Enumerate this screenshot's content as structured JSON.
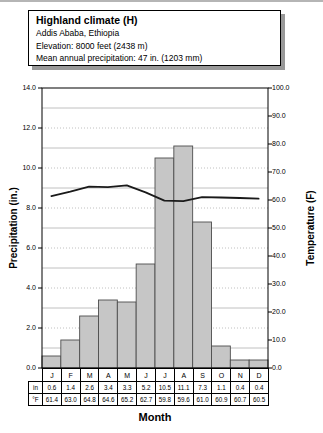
{
  "header": {
    "title": "Highland climate (H)",
    "city": "Addis Ababa, Ethiopia",
    "elevation": "Elevation: 8000 feet (2438 m)",
    "precipitation": "Mean annual precipitation: 47 in. (1203 mm)"
  },
  "chart_data": {
    "type": "bar",
    "categories": [
      "J",
      "F",
      "M",
      "A",
      "M",
      "J",
      "J",
      "A",
      "S",
      "O",
      "N",
      "D"
    ],
    "series": [
      {
        "name": "Precipitation",
        "type": "bar",
        "axis": "left",
        "values": [
          0.6,
          1.4,
          2.6,
          3.4,
          3.3,
          5.2,
          10.5,
          11.1,
          7.3,
          1.1,
          0.4,
          0.4
        ]
      },
      {
        "name": "Temperature",
        "type": "line",
        "axis": "right",
        "values": [
          61.4,
          63.0,
          64.8,
          64.6,
          65.2,
          62.7,
          59.8,
          59.6,
          61.0,
          60.9,
          60.7,
          60.5
        ]
      }
    ],
    "left_axis": {
      "label": "Precipitation (in.)",
      "min": 0,
      "max": 14,
      "step": 2,
      "ticks": [
        "14.0",
        "12.0",
        "10.0",
        "8.0",
        "6.0",
        "4.0",
        "2.0",
        "0.0"
      ]
    },
    "right_axis": {
      "label": "Temperature (F)",
      "min": 0,
      "max": 100,
      "step": 10,
      "ticks": [
        "100.0",
        "90.0",
        "80.0",
        "70.0",
        "60.0",
        "50.0",
        "40.0",
        "30.0",
        "20.0",
        "10.0",
        "0.0"
      ]
    },
    "xlabel": "Month",
    "table_row_labels": [
      "in",
      "°F"
    ],
    "grid": "horizontal, every 1 in (dotted on even values, solid on odd)",
    "legend_position": "none"
  },
  "colors": {
    "bar_fill": "#c6c6c6",
    "bar_stroke": "#4d4d4d",
    "line_color": "#1a1a1a",
    "grid_color": "#b0b0b0",
    "axis_color": "#000000",
    "box_shadow": "#999999"
  }
}
